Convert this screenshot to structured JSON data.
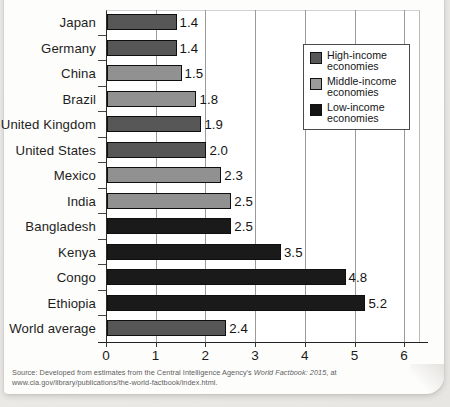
{
  "chart_data": {
    "type": "bar",
    "orientation": "horizontal",
    "title": "",
    "xlabel": "",
    "ylabel": "",
    "xlim": [
      0,
      6
    ],
    "grid": true,
    "xticks": [
      "0",
      "1",
      "2",
      "3",
      "4",
      "5",
      "6"
    ],
    "categories": [
      "Japan",
      "Germany",
      "China",
      "Brazil",
      "United Kingdom",
      "United States",
      "Mexico",
      "India",
      "Bangladesh",
      "Kenya",
      "Congo",
      "Ethiopia",
      "World average"
    ],
    "values": [
      1.4,
      1.4,
      1.5,
      1.8,
      1.9,
      2.0,
      2.3,
      2.5,
      2.5,
      3.5,
      4.8,
      5.2,
      2.4
    ],
    "value_labels": [
      "1.4",
      "1.4",
      "1.5",
      "1.8",
      "1.9",
      "2.0",
      "2.3",
      "2.5",
      "2.5",
      "3.5",
      "4.8",
      "5.2",
      "2.4"
    ],
    "groups": [
      "high",
      "high",
      "middle",
      "middle",
      "high",
      "high",
      "middle",
      "middle",
      "low",
      "low",
      "low",
      "low",
      "high"
    ],
    "legend_position": "top-right",
    "legend": [
      {
        "key": "high",
        "label": "High-income economies",
        "color": "#575757"
      },
      {
        "key": "middle",
        "label": "Middle-income economies",
        "color": "#919191"
      },
      {
        "key": "low",
        "label": "Low-income economies",
        "color": "#1a1a1a"
      }
    ]
  },
  "legend": {
    "items": [
      {
        "line1": "High-income",
        "line2": "economies"
      },
      {
        "line1": "Middle-income",
        "line2": "economies"
      },
      {
        "line1": "Low-income",
        "line2": "economies"
      }
    ]
  },
  "source": {
    "prefix": "Source: Developed from estimates from the Central Intelligence Agency's ",
    "italic": "World Factbook: 2015",
    "suffix": ", at www.cia.gov/library/publications/the-world-factbook/index.html."
  }
}
